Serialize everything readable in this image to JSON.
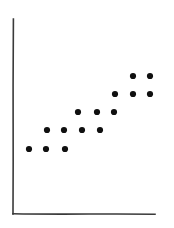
{
  "figure": {
    "title": "",
    "background_color": "#ffffff",
    "width": 174,
    "height": 228
  },
  "axes": {
    "style": "hand-drawn L-shaped spine",
    "color": "#3a3a3a",
    "y_axis": {
      "x": 13,
      "y_top": 19,
      "y_bottom": 214
    },
    "x_axis": {
      "y": 214,
      "x_left": 13,
      "x_right": 155
    },
    "ticks": "none",
    "gridlines": "none",
    "tick_labels": "none"
  },
  "marker": {
    "shape": "filled-circle",
    "color": "#101010",
    "radius_px": 3.1
  },
  "chart_data": {
    "type": "scatter",
    "title": "",
    "xlabel": "",
    "ylabel": "",
    "grid": false,
    "legend": "none",
    "n_points": 15,
    "xlim": [
      0,
      10
    ],
    "ylim": [
      0,
      10
    ],
    "x": [
      1.0,
      2.0,
      3.0,
      2.0,
      3.0,
      4.0,
      5.0,
      4.0,
      5.0,
      6.0,
      6.0,
      7.0,
      7.0,
      8.0,
      9.0
    ],
    "y": [
      2.0,
      2.0,
      2.0,
      3.0,
      3.0,
      3.0,
      3.0,
      4.0,
      4.0,
      4.0,
      5.0,
      5.0,
      6.0,
      6.0,
      6.0
    ],
    "points_px": [
      {
        "cx": 29,
        "cy": 149
      },
      {
        "cx": 46,
        "cy": 149
      },
      {
        "cx": 65,
        "cy": 149
      },
      {
        "cx": 47,
        "cy": 130
      },
      {
        "cx": 64,
        "cy": 130
      },
      {
        "cx": 82,
        "cy": 130
      },
      {
        "cx": 100,
        "cy": 130
      },
      {
        "cx": 78,
        "cy": 112
      },
      {
        "cx": 97,
        "cy": 112
      },
      {
        "cx": 114,
        "cy": 112
      },
      {
        "cx": 115,
        "cy": 94
      },
      {
        "cx": 133,
        "cy": 94
      },
      {
        "cx": 133,
        "cy": 76
      },
      {
        "cx": 150,
        "cy": 76
      },
      {
        "cx": 150,
        "cy": 94
      }
    ]
  }
}
